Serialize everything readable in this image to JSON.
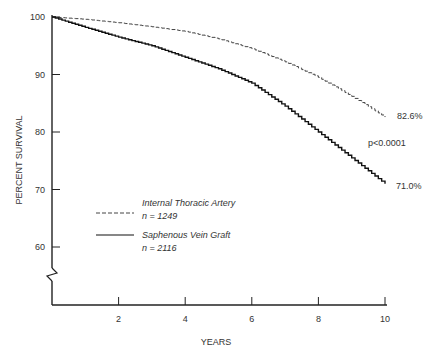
{
  "chart_data": {
    "type": "line",
    "title": "",
    "xlabel": "YEARS",
    "ylabel": "PERCENT SURVIVAL",
    "xlim": [
      0,
      10
    ],
    "ylim": [
      55,
      100
    ],
    "x_ticks": [
      2,
      4,
      6,
      8,
      10
    ],
    "y_ticks": [
      60,
      70,
      80,
      90,
      100
    ],
    "y_axis_break": true,
    "grid": false,
    "legend_position": "lower-left inside",
    "x": [
      0,
      1,
      2,
      3,
      4,
      5,
      6,
      7,
      8,
      9,
      10
    ],
    "series": [
      {
        "name": "Internal Thoracic Artery",
        "n_label": "n = 1249",
        "style": "dashed",
        "values": [
          100,
          99.6,
          99.0,
          98.3,
          97.5,
          96.2,
          94.5,
          92.2,
          89.5,
          86.2,
          82.6
        ],
        "end_label": "82.6%"
      },
      {
        "name": "Saphenous Vein Graft",
        "n_label": "n = 2116",
        "style": "solid",
        "values": [
          100,
          98.2,
          96.5,
          95.0,
          93.0,
          91.0,
          88.5,
          84.5,
          80.0,
          75.5,
          71.0
        ],
        "end_label": "71.0%"
      }
    ],
    "annotations": [
      "p<0.0001"
    ]
  }
}
